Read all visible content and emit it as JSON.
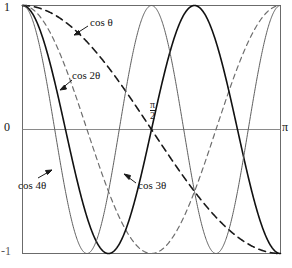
{
  "chart_data": {
    "type": "line",
    "title": "",
    "xlabel": "",
    "ylabel": "",
    "xlim": [
      0,
      3.14159265
    ],
    "ylim": [
      -1,
      1
    ],
    "grid": false,
    "legend_position": "inline-annotations",
    "x_tick_labels": [
      "",
      "π/2",
      "π"
    ],
    "y_tick_labels": [
      "1",
      "0",
      "-1"
    ],
    "series": [
      {
        "name": "cos θ",
        "style": "dashed",
        "color": "#1a1a1a",
        "x": [
          0,
          0.15708,
          0.31416,
          0.47124,
          0.62832,
          0.7854,
          0.94248,
          1.09956,
          1.25664,
          1.41372,
          1.5708,
          1.72788,
          1.88496,
          2.04204,
          2.19911,
          2.35619,
          2.51327,
          2.67035,
          2.82743,
          2.98451,
          3.14159
        ],
        "y": [
          1.0,
          0.9877,
          0.9511,
          0.891,
          0.809,
          0.7071,
          0.5878,
          0.454,
          0.309,
          0.1564,
          0.0,
          -0.1564,
          -0.309,
          -0.454,
          -0.5878,
          -0.7071,
          -0.809,
          -0.891,
          -0.9511,
          -0.9877,
          -1.0
        ]
      },
      {
        "name": "cos 2θ",
        "style": "dashed",
        "color": "#6e6e6e",
        "x": [
          0,
          0.15708,
          0.31416,
          0.47124,
          0.62832,
          0.7854,
          0.94248,
          1.09956,
          1.25664,
          1.41372,
          1.5708,
          1.72788,
          1.88496,
          2.04204,
          2.19911,
          2.35619,
          2.51327,
          2.67035,
          2.82743,
          2.98451,
          3.14159
        ],
        "y": [
          1.0,
          0.9511,
          0.809,
          0.5878,
          0.309,
          0.0,
          -0.309,
          -0.5878,
          -0.809,
          -0.9511,
          -1.0,
          -0.9511,
          -0.809,
          -0.5878,
          -0.309,
          0.0,
          0.309,
          0.5878,
          0.809,
          0.9511,
          1.0
        ]
      },
      {
        "name": "cos 3θ",
        "style": "solid",
        "color": "#111111",
        "x": [
          0,
          0.15708,
          0.31416,
          0.47124,
          0.62832,
          0.7854,
          0.94248,
          1.09956,
          1.25664,
          1.41372,
          1.5708,
          1.72788,
          1.88496,
          2.04204,
          2.19911,
          2.35619,
          2.51327,
          2.67035,
          2.82743,
          2.98451,
          3.14159
        ],
        "y": [
          1.0,
          0.891,
          0.5878,
          0.1564,
          -0.309,
          -0.7071,
          -0.9511,
          -0.9877,
          -0.809,
          -0.454,
          0.0,
          0.454,
          0.809,
          0.9877,
          0.9511,
          0.7071,
          0.309,
          -0.1564,
          -0.5878,
          -0.891,
          -1.0
        ]
      },
      {
        "name": "cos 4θ",
        "style": "solid",
        "color": "#5f5f5f",
        "x": [
          0,
          0.15708,
          0.31416,
          0.47124,
          0.62832,
          0.7854,
          0.94248,
          1.09956,
          1.25664,
          1.41372,
          1.5708,
          1.72788,
          1.88496,
          2.04204,
          2.19911,
          2.35619,
          2.51327,
          2.67035,
          2.82743,
          2.98451,
          3.14159
        ],
        "y": [
          1.0,
          0.809,
          0.309,
          -0.309,
          -0.809,
          -1.0,
          -0.809,
          -0.309,
          0.309,
          0.809,
          1.0,
          0.809,
          0.309,
          -0.309,
          -0.809,
          -1.0,
          -0.809,
          -0.309,
          0.309,
          0.809,
          1.0
        ]
      }
    ],
    "annotations": [
      {
        "text": "cos θ",
        "arrow": "down-left"
      },
      {
        "text": "cos 2θ",
        "arrow": "down-left"
      },
      {
        "text": "cos 3θ",
        "arrow": "up-left"
      },
      {
        "text": "cos 4θ",
        "arrow": "up-right"
      }
    ]
  },
  "axis": {
    "y_top_label": "1",
    "y_zero_label": "0",
    "y_bottom_label": "-1",
    "x_right_label": "π",
    "x_mid_numerator": "π",
    "x_mid_denominator": "2"
  },
  "labels": {
    "cos_theta": "cos θ",
    "cos_2theta": "cos 2θ",
    "cos_3theta": "cos 3θ",
    "cos_4theta": "cos 4θ"
  },
  "colors": {
    "background": "#ffffff",
    "frame": "#6b6b6b",
    "zero_line": "#8a8a8a",
    "cos_theta": "#1a1a1a",
    "cos_2theta": "#6e6e6e",
    "cos_3theta": "#111111",
    "cos_4theta": "#5f5f5f"
  }
}
